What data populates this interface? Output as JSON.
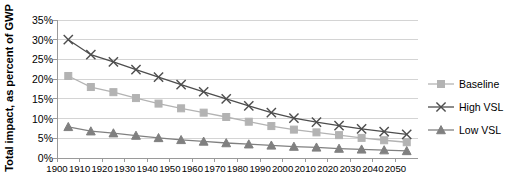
{
  "chart_data": {
    "type": "line",
    "title": "",
    "xlabel": "",
    "ylabel": "Total impact, as percent of GWP",
    "x": [
      1905,
      1915,
      1925,
      1935,
      1945,
      1955,
      1965,
      1975,
      1985,
      1995,
      2005,
      2015,
      2025,
      2035,
      2045,
      2055
    ],
    "xlim": [
      1900,
      2060
    ],
    "ylim": [
      0,
      35
    ],
    "y_tick_labels": [
      "0%",
      "5%",
      "10%",
      "15%",
      "20%",
      "25%",
      "30%",
      "35%"
    ],
    "y_tick_values": [
      0,
      5,
      10,
      15,
      20,
      25,
      30,
      35
    ],
    "x_tick_labels": [
      "1900",
      "1910",
      "1920",
      "1930",
      "1940",
      "1950",
      "1960",
      "1970",
      "1980",
      "1990",
      "2000",
      "2010",
      "2020",
      "2030",
      "2040",
      "2050"
    ],
    "x_tick_values": [
      1900,
      1910,
      1920,
      1930,
      1940,
      1950,
      1960,
      1970,
      1980,
      1990,
      2000,
      2010,
      2020,
      2030,
      2040,
      2050
    ],
    "grid": true,
    "legend_position": "right",
    "series": [
      {
        "name": "Baseline",
        "marker": "square",
        "color": "#b3b3b3",
        "values": [
          20.8,
          18.0,
          16.7,
          15.2,
          13.8,
          12.6,
          11.5,
          10.4,
          9.2,
          8.1,
          7.2,
          6.5,
          5.8,
          5.1,
          4.5,
          4.0
        ]
      },
      {
        "name": "High VSL",
        "marker": "x",
        "color": "#4d4d4d",
        "values": [
          30.0,
          26.2,
          24.4,
          22.4,
          20.5,
          18.6,
          16.8,
          15.0,
          13.2,
          11.5,
          10.1,
          9.1,
          8.2,
          7.4,
          6.7,
          6.0
        ]
      },
      {
        "name": "Low VSL",
        "marker": "triangle",
        "color": "#808080",
        "values": [
          7.9,
          6.8,
          6.3,
          5.7,
          5.1,
          4.6,
          4.2,
          3.8,
          3.5,
          3.2,
          2.9,
          2.7,
          2.4,
          2.2,
          2.0,
          1.8
        ]
      }
    ]
  },
  "legend": {
    "items": [
      {
        "label": "Baseline",
        "marker": "square-marker",
        "color": "#b3b3b3"
      },
      {
        "label": "High VSL",
        "marker": "x-marker",
        "color": "#4d4d4d"
      },
      {
        "label": "Low VSL",
        "marker": "triangle-marker",
        "color": "#808080"
      }
    ]
  },
  "clipped_caption": ""
}
